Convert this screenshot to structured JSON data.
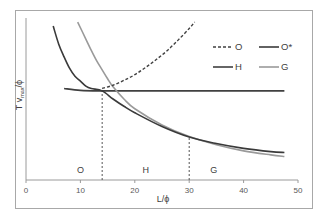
{
  "chart_data": {
    "type": "line",
    "title": "",
    "xlabel": "L/ϕ",
    "ylabel": "T v_max/ϕ",
    "ylabel_main": "T v",
    "ylabel_sub": "max",
    "ylabel_tail": "/ϕ",
    "xlim": [
      0,
      50
    ],
    "ylim": [
      0,
      1
    ],
    "xticks": [
      0,
      10,
      20,
      30,
      40,
      50
    ],
    "xtick_labels": [
      "0",
      "10",
      "20",
      "30",
      "40",
      "50"
    ],
    "yticks": [],
    "grid": false,
    "legend_position": "top-right",
    "series": [
      {
        "name": "O",
        "style": "dashed",
        "color": "#404040",
        "x": [
          14,
          16,
          18,
          20,
          22,
          24,
          26,
          28,
          30,
          31
        ],
        "y": [
          0.565,
          0.585,
          0.615,
          0.65,
          0.695,
          0.745,
          0.8,
          0.865,
          0.935,
          0.975
        ]
      },
      {
        "name": "O*",
        "style": "solid",
        "color": "#3a3a3a",
        "x": [
          5,
          6,
          7,
          8,
          9,
          10,
          11,
          12,
          14,
          16,
          18,
          20,
          25,
          30,
          35,
          40,
          45,
          47.5
        ],
        "y": [
          0.95,
          0.84,
          0.76,
          0.69,
          0.64,
          0.61,
          0.58,
          0.565,
          0.55,
          0.5,
          0.455,
          0.415,
          0.33,
          0.265,
          0.225,
          0.195,
          0.175,
          0.17
        ]
      },
      {
        "name": "H",
        "style": "solid",
        "color": "#404040",
        "x": [
          7,
          10,
          14,
          20,
          30,
          40,
          47.5
        ],
        "y": [
          0.565,
          0.553,
          0.55,
          0.55,
          0.55,
          0.55,
          0.55
        ]
      },
      {
        "name": "G",
        "style": "solid",
        "color": "#9a9a9a",
        "x": [
          9.5,
          11,
          12,
          13,
          14,
          15,
          16,
          18,
          20,
          25,
          30,
          35,
          40,
          45,
          47.5
        ],
        "y": [
          0.975,
          0.87,
          0.8,
          0.735,
          0.68,
          0.625,
          0.575,
          0.5,
          0.44,
          0.34,
          0.268,
          0.218,
          0.18,
          0.155,
          0.145
        ]
      }
    ],
    "vlines": [
      {
        "x": 14,
        "style": "dashed",
        "from_y": 0,
        "to_y": 0.55
      },
      {
        "x": 30,
        "style": "dashed",
        "from_y": 0,
        "to_y": 0.265
      }
    ],
    "annotations": [
      {
        "text": "O",
        "x": 10,
        "y": 0.07
      },
      {
        "text": "H",
        "x": 22,
        "y": 0.07
      },
      {
        "text": "G",
        "x": 34.5,
        "y": 0.07
      }
    ]
  }
}
